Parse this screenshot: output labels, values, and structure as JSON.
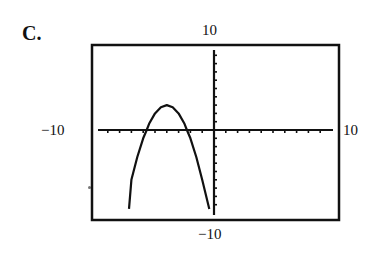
{
  "option_label": "C.",
  "window_labels": {
    "ymax": "10",
    "ymin": "−10",
    "xmin": "−10",
    "xmax": "10"
  },
  "chart_data": {
    "type": "line",
    "title": "",
    "xlabel": "",
    "ylabel": "",
    "xlim": [
      -10,
      10
    ],
    "ylim": [
      -10,
      10
    ],
    "grid": false,
    "axis_ticks": {
      "x_step": 1,
      "y_step": 1
    },
    "series": [
      {
        "name": "parabola",
        "description": "downward-opening parabola, vertex near (-4, 3), x-intercepts near -5.7 and -2.3",
        "vertex": [
          -4,
          3
        ],
        "x_intercepts": [
          -5.7,
          -2.3
        ],
        "points": [
          [
            -7.2,
            -9.5
          ],
          [
            -7,
            -6
          ],
          [
            -6.5,
            -3.25
          ],
          [
            -6,
            -1
          ],
          [
            -5.7,
            0
          ],
          [
            -5.5,
            0.75
          ],
          [
            -5,
            2
          ],
          [
            -4.5,
            2.75
          ],
          [
            -4,
            3
          ],
          [
            -3.5,
            2.75
          ],
          [
            -3,
            2
          ],
          [
            -2.5,
            0.75
          ],
          [
            -2.3,
            0
          ],
          [
            -2,
            -1
          ],
          [
            -1.5,
            -3.25
          ],
          [
            -1,
            -6
          ],
          [
            -0.4,
            -9.5
          ]
        ]
      }
    ],
    "legend": null
  }
}
